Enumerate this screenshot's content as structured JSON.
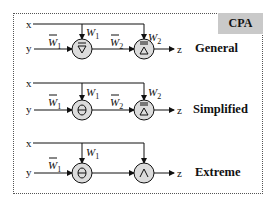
{
  "title_badge": "CPA",
  "colors": {
    "badge_bg": "#c9c9c9",
    "node_fill": "#dcdcdc",
    "line": "#111111"
  },
  "inputs": {
    "x": "x",
    "y": "y",
    "output": "z"
  },
  "weights": {
    "w1": "W",
    "w1_sub": "1",
    "w2": "W",
    "w2_sub": "2"
  },
  "rows": [
    {
      "label": "General",
      "node1": "inverted-triangle-with-bar (complement of min)",
      "node2": "triangle-with-double-bar",
      "weights_on_edges": [
        "W̄1",
        "W1",
        "W̄2",
        "W2"
      ]
    },
    {
      "label": "Simplified",
      "node1": "theta (difference)",
      "node2": "triangle-with-double-bar",
      "weights_on_edges": [
        "W̄1",
        "W1",
        "W̄2",
        "W2"
      ]
    },
    {
      "label": "Extreme",
      "node1": "theta (difference)",
      "node2": "wedge (AND)",
      "weights_on_edges": [
        "W̄1",
        "W1"
      ]
    }
  ]
}
